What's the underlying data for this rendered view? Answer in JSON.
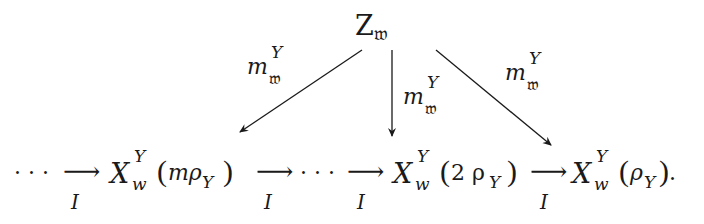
{
  "diagram": {
    "top_node": {
      "main": "Z",
      "subscript": "𝔴"
    },
    "arrows_down": [
      {
        "label_main": "m",
        "label_sup": "Y",
        "label_sub": "𝔴",
        "target": "X_w^Y(mρ_Y)"
      },
      {
        "label_main": "m",
        "label_sup": "Y",
        "label_sub": "𝔴",
        "target": "X_w^Y(2ρ_Y)"
      },
      {
        "label_main": "m",
        "label_sup": "Y",
        "label_sub": "𝔴",
        "target": "X_w^Y(ρ_Y)"
      }
    ],
    "bottom_row": {
      "leading_dots": "· · ·",
      "mid_dots": "· · ·",
      "arrow_glyph": "⟶",
      "arrow_label": "I",
      "nodes": [
        {
          "main": "X",
          "sup": "Y",
          "sub": "w",
          "arg": "mρ",
          "arg_sub": "Y"
        },
        {
          "main": "X",
          "sup": "Y",
          "sub": "w",
          "arg": "2 ρ",
          "arg_sub": "Y"
        },
        {
          "main": "X",
          "sup": "Y",
          "sub": "w",
          "arg": "ρ",
          "arg_sub": "Y"
        }
      ],
      "trailing_punct": "."
    }
  }
}
